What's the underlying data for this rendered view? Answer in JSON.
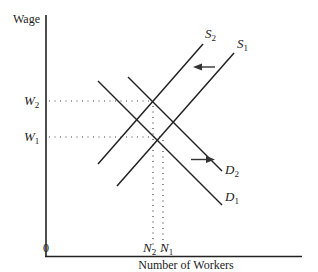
{
  "diagram": {
    "type": "labor-market-supply-demand",
    "y_axis_label": "Wage",
    "x_axis_label": "Number of Workers",
    "origin_label": "0",
    "wage_levels": [
      {
        "id": "W2",
        "base": "W",
        "sub": "2"
      },
      {
        "id": "W1",
        "base": "W",
        "sub": "1"
      }
    ],
    "worker_levels": [
      {
        "id": "N2",
        "base": "N",
        "sub": "2"
      },
      {
        "id": "N1",
        "base": "N",
        "sub": "1"
      }
    ],
    "curves": [
      {
        "id": "S2",
        "base": "S",
        "sub": "2",
        "kind": "supply"
      },
      {
        "id": "S1",
        "base": "S",
        "sub": "1",
        "kind": "supply"
      },
      {
        "id": "D2",
        "base": "D",
        "sub": "2",
        "kind": "demand"
      },
      {
        "id": "D1",
        "base": "D",
        "sub": "1",
        "kind": "demand"
      }
    ],
    "shifts": [
      {
        "from": "S1",
        "to": "S2",
        "direction": "left"
      },
      {
        "from": "D1",
        "to": "D2",
        "direction": "right"
      }
    ]
  }
}
